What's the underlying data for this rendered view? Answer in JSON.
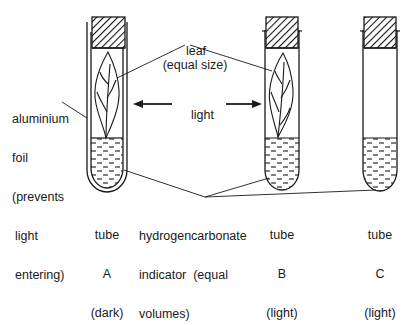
{
  "diagram": {
    "labels": {
      "leaf_line1": "leaf",
      "leaf_line2": "(equal size)",
      "foil_line1": "aluminium",
      "foil_line2": "foil",
      "foil_line3": "(prevents",
      "foil_line4": "light",
      "foil_line5": "entering)",
      "light": "light",
      "indicator_line1": "hydrogencarbonate",
      "indicator_line2": "indicator  (equal",
      "indicator_line3": "volumes)"
    },
    "tubes": [
      {
        "id": "A",
        "line1": "tube",
        "line2": "A",
        "line3": "(dark)",
        "has_leaf": true,
        "foil": true
      },
      {
        "id": "B",
        "line1": "tube",
        "line2": "B",
        "line3": "(light)",
        "has_leaf": true,
        "foil": false
      },
      {
        "id": "C",
        "line1": "tube",
        "line2": "C",
        "line3": "(light)",
        "has_leaf": false,
        "foil": false
      }
    ],
    "colors": {
      "ink": "#1a1a1a",
      "background": "#ffffff"
    }
  }
}
